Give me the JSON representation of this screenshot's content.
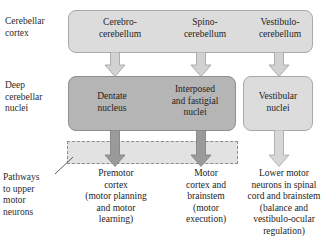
{
  "diagram": {
    "row_labels": {
      "cortex": "Cerebellar\ncortex",
      "deep_nuclei": "Deep\ncerebellar\nnuclei",
      "pathways": "Pathways\nto upper\nmotor\nneurons"
    },
    "cerebellar_cortex": {
      "divisions": [
        {
          "label": "Cerebro-\ncerebellum"
        },
        {
          "label": "Spino-\ncerebellum"
        },
        {
          "label": "Vestibulo-\ncerebellum"
        }
      ]
    },
    "deep_cerebellar_nuclei": {
      "nuclei": [
        {
          "label": "Dentate\nnucleus"
        },
        {
          "label": "Interposed\nand fastigial\nnuclei"
        },
        {
          "label": "Vestibular\nnuclei"
        }
      ]
    },
    "targets": [
      {
        "label": "Premotor\ncortex\n(motor planning\nand motor\nlearning)"
      },
      {
        "label": "Motor\ncortex and\nbrainstem\n(motor\nexecution)"
      },
      {
        "label": "Lower motor\nneurons in spinal\ncord and brainstem\n(balance and\nvestibulo-ocular\nregulation)"
      }
    ],
    "colors": {
      "box_light_fill": "#dcdcdc",
      "box_light_stroke": "#a9a9a9",
      "box_dark_fill": "#b5b5b5",
      "box_dark_stroke": "#8f8f8f",
      "arrow_light_fill": "#d2d2d2",
      "arrow_dark_fill": "#9a9a9a",
      "band_fill": "#e2e2e2",
      "band_stroke": "#8c8c8c",
      "text": "#232323",
      "background": "#ffffff"
    }
  }
}
